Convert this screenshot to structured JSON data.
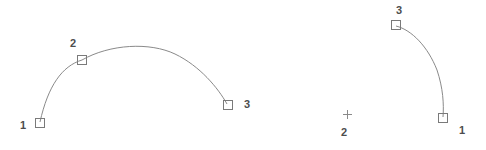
{
  "canvas": {
    "width": 486,
    "height": 150,
    "background_color": "#ffffff",
    "geometry_color": "#8a8a8a",
    "marker_color": "#7a7a7a",
    "label_color": "#4d4d4d"
  },
  "figures": [
    {
      "name": "left-arc",
      "type": "three-point-arc",
      "path": "M 40 122 C 48 86 62 66 82 60 C 110 44 150 42 175 54 C 200 66 218 88 227 104",
      "points": [
        {
          "id": "1",
          "label": "1",
          "marker_x": 40,
          "marker_y": 123,
          "label_x": 20,
          "label_y": 120
        },
        {
          "id": "2",
          "label": "2",
          "marker_x": 82,
          "marker_y": 60,
          "label_x": 70,
          "label_y": 38
        },
        {
          "id": "3",
          "label": "3",
          "marker_x": 228,
          "marker_y": 105,
          "label_x": 244,
          "label_y": 99
        }
      ]
    },
    {
      "name": "right-arc",
      "type": "three-point-arc",
      "path": "M 396 26 C 412 30 428 47 437 70 C 443 88 444 104 443 117",
      "points": [
        {
          "id": "3",
          "label": "3",
          "marker_x": 396,
          "marker_y": 25,
          "label_x": 393,
          "label_y": 5
        },
        {
          "id": "1",
          "label": "1",
          "marker_x": 443,
          "marker_y": 118,
          "label_x": 459,
          "label_y": 125
        }
      ],
      "cursor": {
        "name": "crosshair-cursor",
        "x": 347,
        "y": 114,
        "size": 9,
        "label": "2",
        "label_x": 341,
        "label_y": 127
      }
    }
  ],
  "markers": {
    "square_size": 9,
    "style": "open-square"
  }
}
